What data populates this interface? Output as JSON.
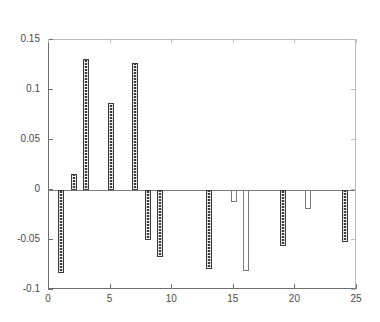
{
  "chart_data": {
    "type": "bar",
    "title": "",
    "subtitle": "",
    "xlabel": "",
    "ylabel": "",
    "xlim": [
      0,
      25
    ],
    "ylim": [
      -0.1,
      0.15
    ],
    "grid": false,
    "legend": null,
    "xticks": [
      "0",
      "5",
      "10",
      "15",
      "20",
      "25"
    ],
    "xtick_values": [
      0,
      5,
      10,
      15,
      20,
      25
    ],
    "yticks": [
      "0.15",
      "0.1",
      "0.05",
      "0",
      "-0.05",
      "-0.1"
    ],
    "ytick_values": [
      0.15,
      0.1,
      0.05,
      0,
      -0.05,
      -0.1
    ],
    "x": [
      1,
      2,
      3,
      5,
      7,
      8,
      9,
      13,
      15,
      16,
      19,
      21,
      24
    ],
    "values": [
      -0.083,
      0.016,
      0.131,
      0.087,
      0.127,
      -0.05,
      -0.067,
      -0.079,
      -0.012,
      -0.081,
      -0.056,
      -0.019,
      -0.052
    ],
    "bars": [
      {
        "x": 1,
        "value": -0.083,
        "style": "dark"
      },
      {
        "x": 2,
        "value": 0.016,
        "style": "dark"
      },
      {
        "x": 3,
        "value": 0.131,
        "style": "dark"
      },
      {
        "x": 5,
        "value": 0.087,
        "style": "dark"
      },
      {
        "x": 7,
        "value": 0.127,
        "style": "dark"
      },
      {
        "x": 8,
        "value": -0.05,
        "style": "dark"
      },
      {
        "x": 9,
        "value": -0.067,
        "style": "dark"
      },
      {
        "x": 13,
        "value": -0.079,
        "style": "dark"
      },
      {
        "x": 15,
        "value": -0.012,
        "style": "light"
      },
      {
        "x": 16,
        "value": -0.081,
        "style": "light"
      },
      {
        "x": 19,
        "value": -0.056,
        "style": "dark"
      },
      {
        "x": 21,
        "value": -0.019,
        "style": "light"
      },
      {
        "x": 24,
        "value": -0.052,
        "style": "dark"
      }
    ]
  }
}
